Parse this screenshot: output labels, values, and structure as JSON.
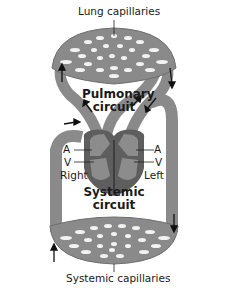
{
  "diagram": {
    "labels": {
      "lung_capillaries": "Lung capillaries",
      "pulmonary_circuit_line1": "Pulmonary",
      "pulmonary_circuit_line2": "circuit",
      "systemic_circuit_line1": "Systemic",
      "systemic_circuit_line2": "circuit",
      "systemic_capillaries": "Systemic capillaries",
      "right_atrium": "A",
      "right_ventricle": "V",
      "left_atrium": "A",
      "left_ventricle": "V",
      "right_side": "Right",
      "left_side": "Left"
    },
    "colors": {
      "vessel": "#8a8a8a",
      "vessel_outline": "#6e6e6e",
      "heart": "#5e5e5e",
      "heart_light": "#8c8c8c",
      "capillary_holes": "#f2f2f2",
      "arrow": "#111111",
      "background": "#ffffff"
    }
  }
}
